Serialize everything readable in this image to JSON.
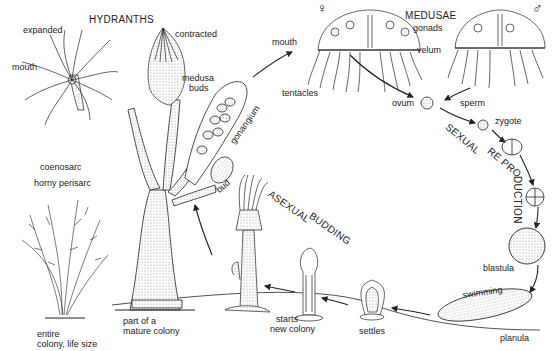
{
  "diagram": {
    "section_titles": {
      "hydranths": "HYDRANTHS",
      "medusae": "MEDUSAE",
      "sexual": "SEXUAL",
      "reproduction": "REPRODUCTION",
      "reproduction_part1": "RE PRO",
      "reproduction_part2": "DUCTION",
      "asexual": "ASEXUAL",
      "budding": "BUDDING"
    },
    "symbols": {
      "female": "♀",
      "male": "♂"
    },
    "labels": {
      "expanded": "expanded",
      "mouth_hydranth": "mouth",
      "contracted": "contracted",
      "medusa_buds_1": "medusa",
      "medusa_buds_2": "buds",
      "gonangium": "gonangium",
      "coenosarc": "coenosarc",
      "horny_perisarc": "horny perisarc",
      "bud": "bud",
      "mouth_medusa": "mouth",
      "gonads": "gonads",
      "velum": "velum",
      "tentacles": "tentacles",
      "ovum": "ovum",
      "sperm": "sperm",
      "zygote": "zygote",
      "blastula": "blastula",
      "swimming": "swimming",
      "planula": "planula",
      "settles": "settles",
      "starts_new_colony_1": "starts",
      "starts_new_colony_2": "new colony",
      "part_mature_1": "part of a",
      "part_mature_2": "mature colony",
      "entire_colony_1": "entire",
      "entire_colony_2": "colony, life size"
    },
    "colors": {
      "ink": "#222222",
      "stipple": "#bdbdbd",
      "background": "#ffffff"
    }
  }
}
